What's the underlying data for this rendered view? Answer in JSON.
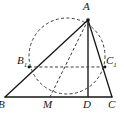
{
  "figure": {
    "kind": "geometry-diagram",
    "width": 124,
    "height": 118,
    "background_color": "#ffffff",
    "stroke_color": "#161616",
    "dash_color": "#3a3a3a"
  },
  "points": {
    "A": {
      "label": "A",
      "sub": "",
      "x": 88,
      "y": 20,
      "label_x": 83,
      "label_y": 2,
      "dot": true
    },
    "B": {
      "label": "B",
      "sub": "",
      "x": 5,
      "y": 97,
      "label_x": 0,
      "label_y": 98,
      "dot": false
    },
    "C": {
      "label": "C",
      "sub": "",
      "x": 112,
      "y": 97,
      "label_x": 109,
      "label_y": 98,
      "dot": false
    },
    "D": {
      "label": "D",
      "sub": "",
      "x": 88,
      "y": 97,
      "label_x": 84,
      "label_y": 98,
      "dot": false
    },
    "M": {
      "label": "M",
      "sub": "",
      "x": 50,
      "y": 97,
      "label_x": 44,
      "label_y": 98,
      "dot": false
    },
    "B1": {
      "label": "B",
      "sub": "1",
      "x": 29,
      "y": 67,
      "label_x": 17,
      "label_y": 54,
      "dot": true
    },
    "C1": {
      "label": "C",
      "sub": "1",
      "x": 105,
      "y": 67,
      "label_x": 106,
      "label_y": 54,
      "dot": true
    }
  },
  "segments": [
    {
      "name": "base-BC",
      "from": "B",
      "to": "C",
      "style": "solid",
      "width": 1.3
    },
    {
      "name": "side-AB",
      "from": "A",
      "to": "B",
      "style": "solid",
      "width": 1.3
    },
    {
      "name": "side-AC",
      "from": "A",
      "to": "C",
      "style": "solid",
      "width": 1.3
    },
    {
      "name": "altitude-AD",
      "from": "A",
      "to": "D",
      "style": "solid",
      "width": 1.5
    },
    {
      "name": "median-AM",
      "from": "A",
      "to": "M",
      "style": "dashed",
      "width": 1.0
    },
    {
      "name": "chord-B1C1",
      "from": "B1",
      "to": "C1",
      "style": "dashed",
      "width": 1.0
    }
  ],
  "circle": {
    "name": "dashed-circle",
    "center_x": 67,
    "center_y": 56,
    "radius": 38,
    "style": "dashed"
  },
  "labels_order": [
    "A",
    "B1",
    "C1",
    "B",
    "M",
    "D",
    "C"
  ]
}
